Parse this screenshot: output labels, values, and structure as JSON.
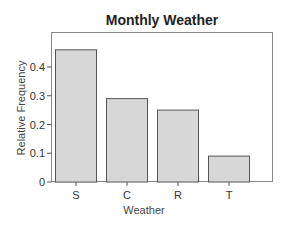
{
  "chart_data": {
    "type": "bar",
    "title": "Monthly Weather",
    "xlabel": "Weather",
    "ylabel": "Relative Frequency",
    "categories": [
      "S",
      "C",
      "R",
      "T"
    ],
    "values": [
      0.46,
      0.29,
      0.25,
      0.09
    ],
    "ylim": [
      0,
      0.5
    ],
    "yticks": [
      0,
      0.1,
      0.2,
      0.3,
      0.4
    ],
    "ytick_labels": [
      "0",
      "0.1",
      "0.2",
      "0.3",
      "0.4"
    ],
    "grid": false,
    "legend": null,
    "colors": {
      "bar_fill": "#d7d7d7",
      "bar_stroke": "#555555",
      "frame": "#888888"
    }
  }
}
